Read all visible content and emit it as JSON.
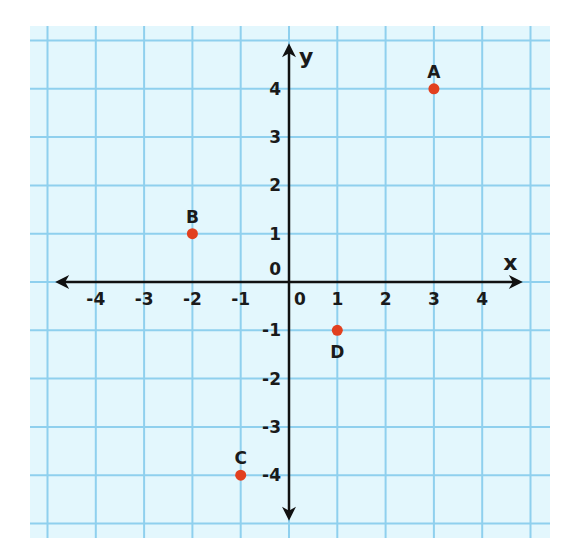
{
  "chart_data": {
    "type": "scatter",
    "title": "",
    "xlabel": "x",
    "ylabel": "y",
    "xlim": [
      -4,
      4
    ],
    "ylim": [
      -4,
      4
    ],
    "grid": true,
    "origin_label": "0",
    "x_ticks": [
      "-4",
      "-3",
      "-2",
      "-1",
      "0",
      "1",
      "2",
      "3",
      "4"
    ],
    "y_ticks": [
      "4",
      "3",
      "2",
      "1",
      "0",
      "-1",
      "-2",
      "-3",
      "-4"
    ],
    "points": [
      {
        "label": "A",
        "x": 3,
        "y": 4
      },
      {
        "label": "B",
        "x": -2,
        "y": 1
      },
      {
        "label": "C",
        "x": -1,
        "y": -4
      },
      {
        "label": "D",
        "x": 1,
        "y": -1
      }
    ]
  },
  "colors": {
    "grid_background": "#e3f7fd",
    "grid_line": "#8fd0ee",
    "axis": "#111111",
    "point": "#e2401f"
  }
}
